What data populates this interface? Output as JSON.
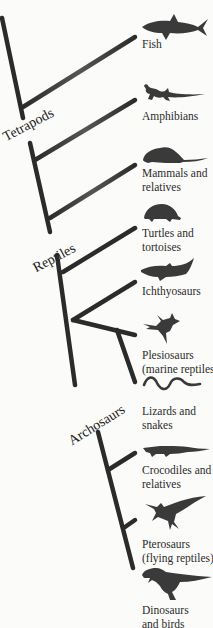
{
  "diagram": {
    "type": "cladogram",
    "colors": {
      "branch": "#2b2b2b",
      "silhouette": "#3a3a3a",
      "background": "#fbfbf9"
    },
    "clades": [
      {
        "label": "Tetrapods"
      },
      {
        "label": "Reptiles"
      },
      {
        "label": "Archosaurs"
      }
    ],
    "taxa": [
      {
        "label": "Fish",
        "icon": "shark-icon"
      },
      {
        "label": "Amphibians",
        "icon": "salamander-icon"
      },
      {
        "label": "Mammals and\nrelatives",
        "icon": "rat-icon"
      },
      {
        "label": "Turtles and\ntortoises",
        "icon": "tortoise-icon"
      },
      {
        "label": "Ichthyosaurs",
        "icon": "ichthyosaur-icon"
      },
      {
        "label": "Plesiosaurs\n(marine reptiles)",
        "icon": "plesiosaur-icon"
      },
      {
        "label": "Lizards and\nsnakes",
        "icon": "snake-icon"
      },
      {
        "label": "Crocodiles and\nrelatives",
        "icon": "crocodile-icon"
      },
      {
        "label": "Pterosaurs\n(flying reptiles)",
        "icon": "pterosaur-icon"
      },
      {
        "label": "Dinosaurs\nand birds",
        "icon": "trex-icon"
      }
    ]
  }
}
